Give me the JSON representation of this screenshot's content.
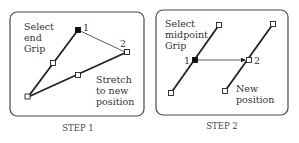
{
  "step1": {
    "caption": "STEP 1",
    "label_select": [
      "Select",
      "end",
      "Grip"
    ],
    "label_stretch": [
      "Stretch",
      "to new",
      "position"
    ],
    "point_1": "1",
    "point_2": "2"
  },
  "step2": {
    "caption": "STEP 2",
    "label_select": [
      "Select",
      "midpoint",
      "Grip"
    ],
    "label_new": [
      "New",
      "position"
    ],
    "point_1": "1",
    "point_2": "2"
  },
  "colors": {
    "stroke": "#222222",
    "panel_border": "#4a4a4a",
    "text": "#333333"
  }
}
